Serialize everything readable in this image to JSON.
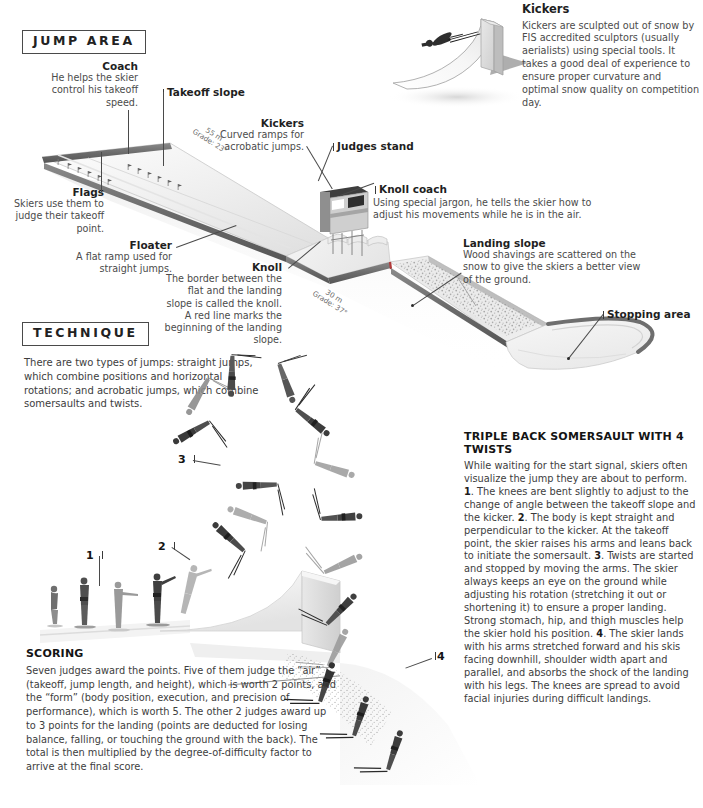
{
  "sections": {
    "jump_area": "JUMP AREA",
    "technique": "TECHNIQUE"
  },
  "kickers_panel": {
    "title": "Kickers",
    "body": "Kickers are sculpted out of snow by FIS accredited sculptors (usually aerialists) using special tools. It takes a good deal of experience to ensure proper curvature and optimal snow quality on competition day."
  },
  "callouts": {
    "coach": {
      "title": "Coach",
      "body": "He helps the skier control his takeoff speed."
    },
    "takeoff_slope": {
      "title": "Takeoff slope"
    },
    "kickers": {
      "title": "Kickers",
      "body": "Curved ramps for acrobatic jumps."
    },
    "judges_stand": {
      "title": "Judges stand"
    },
    "knoll_coach": {
      "title": "Knoll coach",
      "body": "Using special jargon, he tells the skier how to adjust his movements while he is in the air."
    },
    "flags": {
      "title": "Flags",
      "body": "Skiers use them to judge their takeoff point."
    },
    "floater": {
      "title": "Floater",
      "body": "A flat ramp used for straight jumps."
    },
    "knoll": {
      "title": "Knoll",
      "body": "The border between the flat and the landing slope is called the knoll. A red line marks the beginning of the landing slope."
    },
    "landing_slope": {
      "title": "Landing slope",
      "body": "Wood shavings are scattered on the snow to give the skiers a better view of the ground."
    },
    "stopping_area": {
      "title": "Stopping area"
    }
  },
  "measurements": {
    "takeoff": {
      "length": "55 m",
      "grade": "Grade: 23°"
    },
    "landing": {
      "length": "30 m",
      "grade": "Grade: 37°"
    }
  },
  "technique": {
    "body": "There are two types of jumps: straight jumps, which combine positions and horizontal rotations; and acrobatic jumps, which combine somersaults and twists."
  },
  "sequence_numbers": [
    "1",
    "2",
    "3",
    "4"
  ],
  "somersault": {
    "title": "TRIPLE BACK SOMERSAULT WITH 4 TWISTS",
    "paragraph_intro": "While waiting for the start signal, skiers often visualize the jump they are about to perform. ",
    "step1_num": "1",
    "step1_text": ". The knees are bent slightly to adjust to the change of angle between the takeoff slope and the kicker. ",
    "step2_num": "2",
    "step2_text": ". The body is kept straight and perpendicular to the kicker. At the takeoff point, the skier raises his arms and leans back to initiate the somersault. ",
    "step3_num": "3",
    "step3_text": ". Twists are started and stopped by moving the arms. The skier always keeps an eye on the ground while adjusting his rotation (stretching it out or shortening it) to ensure a proper landing. Strong stomach, hip, and thigh muscles help the skier hold his position. ",
    "step4_num": "4",
    "step4_text": ". The skier lands with his arms stretched forward and his skis facing downhill, shoulder width apart and parallel, and absorbs the shock of the landing with his legs. The knees are spread to avoid facial injuries during difficult landings."
  },
  "scoring": {
    "title": "SCORING",
    "body": "Seven judges award the points. Five of them judge the “air” (takeoff, jump length, and height), which is worth 2 points, and the “form” (body position, execution, and precision of performance), which is worth 5. The other 2 judges award up to 3 points for the landing (points are deducted for losing balance, falling, or touching the ground with the back). The total is then multiplied by the degree-of-difficulty factor to arrive at the final score."
  },
  "colors": {
    "ink": "#2b2b2b",
    "rail_dark": "#6e6e6e",
    "snow_light": "#f2f2f2",
    "snow_mid": "#e3e3e3",
    "shaving": "#b9b9b9",
    "accent_red": "#b03a3a"
  }
}
